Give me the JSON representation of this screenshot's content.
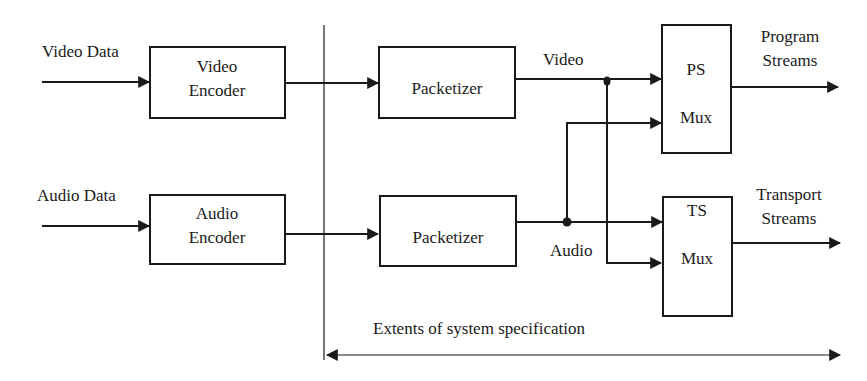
{
  "diagram": {
    "type": "block-diagram",
    "inputs": {
      "video_data": "Video Data",
      "audio_data": "Audio Data"
    },
    "blocks": {
      "video_encoder": {
        "line1": "Video",
        "line2": "Encoder"
      },
      "audio_encoder": {
        "line1": "Audio",
        "line2": "Encoder"
      },
      "video_packetizer": {
        "label": "Packetizer"
      },
      "audio_packetizer": {
        "label": "Packetizer"
      },
      "ps_mux": {
        "line1": "PS",
        "line2": "Mux"
      },
      "ts_mux": {
        "line1": "TS",
        "line2": "Mux"
      }
    },
    "signals": {
      "video": "Video",
      "audio": "Audio"
    },
    "outputs": {
      "program_streams": {
        "line1": "Program",
        "line2": "Streams"
      },
      "transport_streams": {
        "line1": "Transport",
        "line2": "Streams"
      }
    },
    "extent_label": "Extents of system specification",
    "colors": {
      "ink": "#1a1a1a",
      "background": "#ffffff"
    }
  }
}
